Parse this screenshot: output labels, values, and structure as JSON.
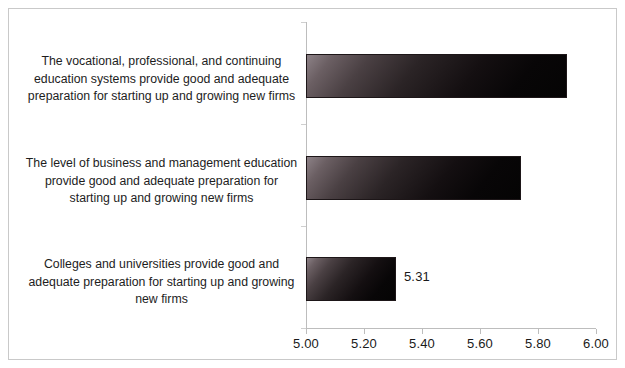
{
  "chart_data": {
    "type": "bar",
    "orientation": "horizontal",
    "title": "",
    "subtitle": "",
    "xlabel": "",
    "ylabel": "",
    "xlim": [
      5.0,
      6.0
    ],
    "xtick_step": 0.2,
    "grid": false,
    "legend": null,
    "bar_color": "#201a1c",
    "categories": [
      "Colleges and universities provide good and\nadequate preparation for starting up and growing\nnew firms",
      "The level of business and management education\nprovide good and adequate preparation for\nstarting up and growing new firms",
      "The vocational, professional, and continuing\neducation systems provide good and adequate\npreparation for starting up and growing new firms"
    ],
    "values": [
      5.31,
      5.74,
      5.9
    ],
    "tick_labels": [
      "5.00",
      "5.20",
      "5.40",
      "5.60",
      "5.80",
      "6.00"
    ],
    "tick_values": [
      5.0,
      5.2,
      5.4,
      5.6,
      5.8,
      6.0
    ],
    "data_labels": [
      {
        "category_index": 0,
        "text": "5.31",
        "visible": true
      },
      {
        "category_index": 1,
        "text": "",
        "visible": false
      },
      {
        "category_index": 2,
        "text": "",
        "visible": false
      }
    ]
  },
  "bars": [
    {
      "name": "bar-vocational-professional-continuing",
      "label": "The vocational, professional, and continuing\neducation systems provide good and adequate\npreparation for starting up and growing new firms",
      "value": 5.9,
      "value_text": "",
      "top": 45,
      "label_top": 44
    },
    {
      "name": "bar-business-management-education",
      "label": "The level of business and management education\nprovide good and adequate preparation for\nstarting up and growing new firms",
      "value": 5.74,
      "value_text": "",
      "top": 147,
      "label_top": 146
    },
    {
      "name": "bar-colleges-universities",
      "label": "Colleges and universities provide good and\nadequate preparation for starting up and growing\nnew firms",
      "value": 5.31,
      "value_text": "5.31",
      "top": 248,
      "label_top": 247
    }
  ],
  "axis": {
    "min": 5.0,
    "max": 6.0,
    "ticks": [
      "5.00",
      "5.20",
      "5.40",
      "5.60",
      "5.80",
      "6.00"
    ]
  }
}
